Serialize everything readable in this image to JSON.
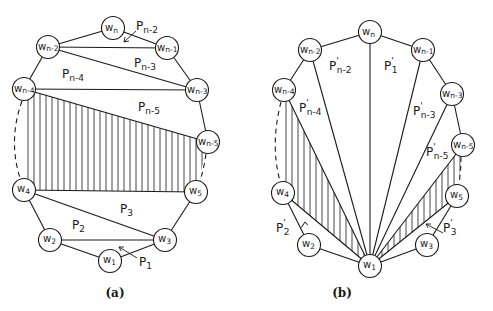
{
  "diagram_a": {
    "caption": "(a)",
    "nodes": {
      "wn": {
        "base": "w",
        "sub": "n",
        "x": 113,
        "y": 28
      },
      "wn2": {
        "base": "w",
        "sub": "n-2",
        "x": 48,
        "y": 47
      },
      "wn1": {
        "base": "w",
        "sub": "n-1",
        "x": 167,
        "y": 48
      },
      "wn4": {
        "base": "w",
        "sub": "n-4",
        "x": 24,
        "y": 89
      },
      "wn3": {
        "base": "w",
        "sub": "n-3",
        "x": 197,
        "y": 90
      },
      "wn5": {
        "base": "w",
        "sub": "n-5",
        "x": 208,
        "y": 142
      },
      "w4": {
        "base": "w",
        "sub": "4",
        "x": 24,
        "y": 190
      },
      "w5": {
        "base": "w",
        "sub": "5",
        "x": 196,
        "y": 192
      },
      "w2": {
        "base": "w",
        "sub": "2",
        "x": 50,
        "y": 240
      },
      "w3": {
        "base": "w",
        "sub": "3",
        "x": 165,
        "y": 240
      },
      "w1": {
        "base": "w",
        "sub": "1",
        "x": 110,
        "y": 261
      }
    },
    "regions": {
      "pn2": {
        "base": "P",
        "sub": "n-2"
      },
      "pn3": {
        "base": "P",
        "sub": "n-3"
      },
      "pn4": {
        "base": "P",
        "sub": "n-4"
      },
      "pn5": {
        "base": "P",
        "sub": "n-5"
      },
      "p3": {
        "base": "P",
        "sub": "3"
      },
      "p2": {
        "base": "P",
        "sub": "2"
      },
      "p1": {
        "base": "P",
        "sub": "1"
      }
    }
  },
  "diagram_b": {
    "caption": "(b)",
    "nodes": {
      "wn": {
        "base": "w",
        "sub": "n",
        "x": 370,
        "y": 32
      },
      "wn2": {
        "base": "w",
        "sub": "n-2",
        "x": 310,
        "y": 50
      },
      "wn1": {
        "base": "w",
        "sub": "n-1",
        "x": 423,
        "y": 50
      },
      "wn4": {
        "base": "w",
        "sub": "n-4",
        "x": 284,
        "y": 90
      },
      "wn3": {
        "base": "w",
        "sub": "n-3",
        "x": 452,
        "y": 94
      },
      "wn5": {
        "base": "w",
        "sub": "n-5",
        "x": 463,
        "y": 145
      },
      "w4": {
        "base": "w",
        "sub": "4",
        "x": 283,
        "y": 193
      },
      "w5": {
        "base": "w",
        "sub": "5",
        "x": 457,
        "y": 196
      },
      "w2": {
        "base": "w",
        "sub": "2",
        "x": 309,
        "y": 245
      },
      "w3": {
        "base": "w",
        "sub": "3",
        "x": 427,
        "y": 245
      },
      "w1": {
        "base": "w",
        "sub": "1",
        "x": 370,
        "y": 266
      }
    },
    "regions": {
      "pn2": {
        "base": "P",
        "prime": "'",
        "sub": "n-2"
      },
      "p1": {
        "base": "P",
        "prime": "'",
        "sub": "1"
      },
      "pn4": {
        "base": "P",
        "prime": "'",
        "sub": "n-4"
      },
      "pn3": {
        "base": "P",
        "prime": "'",
        "sub": "n-3"
      },
      "pn5": {
        "base": "P",
        "prime": "'",
        "sub": "n-5"
      },
      "p2": {
        "base": "P",
        "prime": "'",
        "sub": "2"
      },
      "p3": {
        "base": "P",
        "prime": "'",
        "sub": "3"
      }
    }
  }
}
